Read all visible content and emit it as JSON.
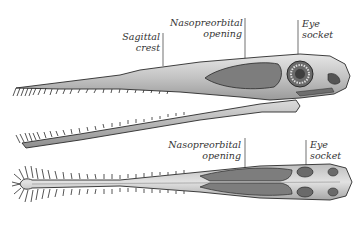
{
  "figure": {
    "lateral_view": {
      "labels": [
        {
          "id": "sagittal-crest",
          "text": "Sagittal crest"
        },
        {
          "id": "nasopreorbital-opening",
          "line1": "Nasopreorbital",
          "line2": "opening"
        },
        {
          "id": "eye-socket",
          "line1": "Eye",
          "line2": "socket"
        }
      ]
    },
    "dorsal_view": {
      "labels": [
        {
          "id": "nasopreorbital-opening",
          "line1": "Nasopreorbital",
          "line2": "opening"
        },
        {
          "id": "eye-socket",
          "line1": "Eye",
          "line2": "socket"
        }
      ]
    },
    "colors": {
      "bone_light": "#d8d8d8",
      "bone_mid": "#a8a8a8",
      "opening_dark": "#7a7a7a",
      "outline": "#2a2a2a",
      "label_text": "#333333"
    }
  }
}
